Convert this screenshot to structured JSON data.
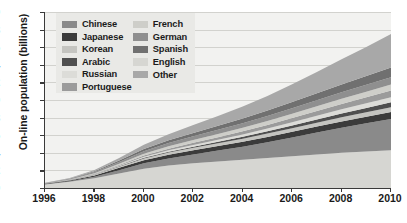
{
  "chart_data": {
    "type": "area",
    "stacked": true,
    "title": "",
    "xlabel": "",
    "ylabel": "On-line population (billions)",
    "x": [
      1996,
      1997,
      1998,
      1999,
      2000,
      2001,
      2002,
      2003,
      2004,
      2005,
      2006,
      2007,
      2008,
      2009,
      2010
    ],
    "xlim": [
      1996,
      2010
    ],
    "ylim": [
      0,
      2.0
    ],
    "xticks": [
      "1996",
      "1998",
      "2000",
      "2002",
      "2004",
      "2006",
      "2008",
      "2010"
    ],
    "yticks": [
      "0",
      "0.2",
      "0.4",
      "0.6",
      "0.8",
      "1.0",
      "1.2",
      "1.4",
      "1.6",
      "1.8",
      "2.0"
    ],
    "grid": true,
    "legend_position": "upper-left-inside",
    "series": [
      {
        "name": "English",
        "color": "#d6d6d2",
        "values": [
          0.04,
          0.07,
          0.11,
          0.165,
          0.22,
          0.255,
          0.28,
          0.3,
          0.32,
          0.34,
          0.36,
          0.38,
          0.4,
          0.415,
          0.43
        ]
      },
      {
        "name": "Chinese",
        "color": "#8a8a8a",
        "values": [
          0.003,
          0.008,
          0.018,
          0.038,
          0.06,
          0.08,
          0.1,
          0.125,
          0.15,
          0.18,
          0.215,
          0.25,
          0.285,
          0.32,
          0.355
        ]
      },
      {
        "name": "Japanese",
        "color": "#3b3b3b",
        "values": [
          0.004,
          0.008,
          0.015,
          0.026,
          0.036,
          0.043,
          0.048,
          0.052,
          0.056,
          0.06,
          0.064,
          0.068,
          0.072,
          0.076,
          0.08
        ]
      },
      {
        "name": "Korean",
        "color": "#c4c4c0",
        "values": [
          0.001,
          0.003,
          0.007,
          0.013,
          0.02,
          0.025,
          0.029,
          0.032,
          0.035,
          0.038,
          0.041,
          0.044,
          0.047,
          0.05,
          0.053
        ]
      },
      {
        "name": "Arabic",
        "color": "#4f4f4f",
        "values": [
          0.0,
          0.001,
          0.002,
          0.004,
          0.007,
          0.01,
          0.013,
          0.017,
          0.021,
          0.026,
          0.031,
          0.037,
          0.043,
          0.049,
          0.056
        ]
      },
      {
        "name": "Russian",
        "color": "#dcdcd8",
        "values": [
          0.001,
          0.002,
          0.004,
          0.007,
          0.011,
          0.015,
          0.019,
          0.023,
          0.027,
          0.032,
          0.037,
          0.042,
          0.047,
          0.052,
          0.058
        ]
      },
      {
        "name": "Portuguese",
        "color": "#9b9b9b",
        "values": [
          0.001,
          0.002,
          0.005,
          0.009,
          0.014,
          0.019,
          0.024,
          0.029,
          0.035,
          0.041,
          0.047,
          0.054,
          0.061,
          0.068,
          0.075
        ]
      },
      {
        "name": "French",
        "color": "#cecec9",
        "values": [
          0.002,
          0.004,
          0.008,
          0.014,
          0.021,
          0.027,
          0.032,
          0.036,
          0.04,
          0.045,
          0.05,
          0.055,
          0.06,
          0.065,
          0.07
        ]
      },
      {
        "name": "German",
        "color": "#8f8f8f",
        "values": [
          0.003,
          0.006,
          0.012,
          0.02,
          0.029,
          0.036,
          0.042,
          0.047,
          0.052,
          0.057,
          0.062,
          0.067,
          0.072,
          0.077,
          0.082
        ]
      },
      {
        "name": "Spanish",
        "color": "#707070",
        "values": [
          0.002,
          0.004,
          0.009,
          0.016,
          0.024,
          0.032,
          0.039,
          0.046,
          0.054,
          0.062,
          0.071,
          0.08,
          0.09,
          0.1,
          0.11
        ]
      },
      {
        "name": "Other",
        "color": "#a8a8a8",
        "values": [
          0.003,
          0.007,
          0.015,
          0.03,
          0.05,
          0.07,
          0.09,
          0.11,
          0.135,
          0.165,
          0.2,
          0.24,
          0.285,
          0.33,
          0.38
        ]
      }
    ]
  },
  "legend": {
    "column1": [
      {
        "label": "Chinese",
        "color": "#8a8a8a"
      },
      {
        "label": "Japanese",
        "color": "#3b3b3b"
      },
      {
        "label": "Korean",
        "color": "#c4c4c0"
      },
      {
        "label": "Arabic",
        "color": "#4f4f4f"
      },
      {
        "label": "Russian",
        "color": "#dcdcd8"
      },
      {
        "label": "Portuguese",
        "color": "#9b9b9b"
      }
    ],
    "column2": [
      {
        "label": "French",
        "color": "#cecec9"
      },
      {
        "label": "German",
        "color": "#8f8f8f"
      },
      {
        "label": "Spanish",
        "color": "#707070"
      },
      {
        "label": "English",
        "color": "#d6d6d2"
      },
      {
        "label": "Other",
        "color": "#a8a8a8"
      }
    ]
  },
  "colors": {
    "plot_background": "#f2f2f0",
    "legend_background": "#e9e9e6",
    "axis": "#3a3a3a",
    "gridline": "#d2d2ce",
    "text": "#1a1a1a"
  }
}
